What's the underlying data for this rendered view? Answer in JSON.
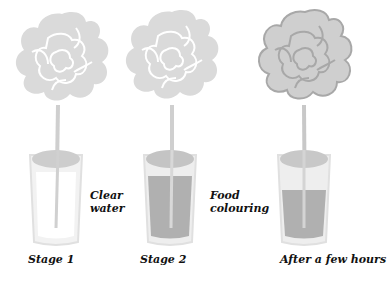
{
  "diagram": {
    "title": "",
    "stages": [
      {
        "label": "Stage 1",
        "side_label_line1": "Clear",
        "side_label_line2": "water",
        "liquid_color": "#ffffff",
        "flower_color": "#d9d9d9",
        "flower_outline": "#ffffff"
      },
      {
        "label": "Stage 2",
        "side_label_line1": "Food",
        "side_label_line2": "colouring",
        "liquid_color": "#b5b5b5",
        "flower_color": "#d9d9d9",
        "flower_outline": "#ffffff"
      },
      {
        "label": "After a few hours",
        "side_label_line1": "",
        "side_label_line2": "",
        "liquid_color": "#b5b5b5",
        "flower_color": "#cccccc",
        "flower_outline": "#a8a8a8"
      }
    ]
  }
}
